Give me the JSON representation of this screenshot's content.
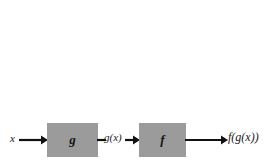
{
  "diagram": {
    "type": "function-composition-flow",
    "background_color": "#ffffff",
    "box_fill_color": "#9b9b9b",
    "stroke_color": "#111111",
    "labels": {
      "input": "x",
      "intermediate": "g(x)",
      "output": "f(g(x))"
    },
    "boxes": [
      {
        "id": "g",
        "label": "g"
      },
      {
        "id": "f",
        "label": "f"
      }
    ],
    "connectors": [
      {
        "id": "arrow-x-to-g",
        "kind": "arrow",
        "from": "x",
        "to": "g"
      },
      {
        "id": "line-g-to-mid",
        "kind": "line",
        "from": "g",
        "to": "g(x)"
      },
      {
        "id": "arrow-mid-to-f",
        "kind": "arrow",
        "from": "g(x)",
        "to": "f"
      },
      {
        "id": "arrow-f-to-out",
        "kind": "arrow",
        "from": "f",
        "to": "f(g(x))"
      }
    ]
  }
}
